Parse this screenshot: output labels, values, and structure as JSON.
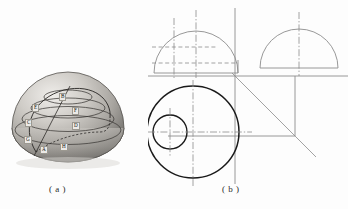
{
  "figure": {
    "type": "engineering-drawing",
    "captions": {
      "a": "( a )",
      "b": "( b )"
    }
  },
  "panel_a": {
    "title": "hemisphere-pictorial",
    "shape": "hemisphere",
    "point_labels": [
      {
        "id": "A",
        "text": "A",
        "x": 40,
        "y": 146
      },
      {
        "id": "B",
        "text": "B",
        "x": 59,
        "y": 93
      },
      {
        "id": "C",
        "text": "C",
        "x": 25,
        "y": 119
      },
      {
        "id": "D",
        "text": "D",
        "x": 72,
        "y": 122
      },
      {
        "id": "E",
        "text": "E",
        "x": 32,
        "y": 104
      },
      {
        "id": "F",
        "text": "F",
        "x": 72,
        "y": 107
      },
      {
        "id": "G",
        "text": "G",
        "x": 24,
        "y": 136
      },
      {
        "id": "H",
        "text": "H",
        "x": 60,
        "y": 143
      }
    ],
    "latitude_circles": 4,
    "great_circle": "tilted section curve through A and B",
    "colors": {
      "highlight": "#e8e6e2",
      "midtone": "#b9b6b1",
      "shadow": "#7e7c78",
      "outline": "#55534f"
    }
  },
  "panel_b": {
    "title": "three-view-orthographic-projection",
    "views": [
      {
        "name": "front-view",
        "geometry": "semicircle-with-hidden-lines",
        "position": "upper-left"
      },
      {
        "name": "side-view",
        "geometry": "semicircle",
        "position": "upper-right"
      },
      {
        "name": "top-view",
        "geometry": "large-circle-with-small-circle",
        "position": "lower-left"
      }
    ],
    "construction": {
      "mitre_line": "45-degree",
      "ground_line": "horizontal-reference",
      "centre_lines": "dash-dot",
      "hidden_lines": "dashed"
    },
    "colors": {
      "object_line": "#1a1a1a",
      "thin_line": "#8c8c8c",
      "centre_line": "#8c8c8c",
      "hidden_line": "#8c8c8c"
    }
  }
}
